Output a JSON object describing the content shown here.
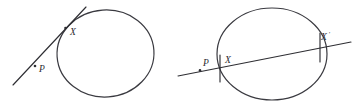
{
  "figure": {
    "background_color": "#ffffff",
    "stroke_color": "#2e2e33",
    "width": 352,
    "height": 108,
    "panels": [
      {
        "name": "tangent-panel",
        "description": "Circle with a tangent line touching at point X, with point P on the tangent line outside the circle",
        "circle": {
          "cx": 105.5,
          "cy": 53.5,
          "rx": 48.5,
          "ry": 43.5,
          "rotation": -4
        },
        "line": {
          "x1": 13,
          "y1": 85,
          "x2": 86,
          "y2": 7
        },
        "points": [
          {
            "label": "P",
            "label_x": 39,
            "label_y": 72,
            "dot_x": 35,
            "dot_y": 66,
            "has_dot": true,
            "prime": ""
          },
          {
            "label": "X",
            "label_x": 70,
            "label_y": 35,
            "dot_x": 65,
            "dot_y": 28,
            "has_dot": true,
            "prime": ""
          }
        ]
      },
      {
        "name": "secant-panel",
        "description": "Circle with a secant line crossing it at points X and X prime, with point P on the line outside the circle",
        "circle": {
          "cx": 272,
          "cy": 54,
          "rx": 55,
          "ry": 46,
          "rotation": 0
        },
        "line": {
          "x1": 178,
          "y1": 76,
          "x2": 351,
          "y2": 42
        },
        "points": [
          {
            "label": "P",
            "label_x": 204,
            "label_y": 66,
            "dot_x": 200,
            "dot_y": 70,
            "has_dot": true,
            "prime": ""
          },
          {
            "label": "X",
            "label_x": 226,
            "label_y": 63,
            "dot_x": 220,
            "dot_y": 68,
            "has_dot": false,
            "prime": ""
          },
          {
            "label": "X",
            "label_x": 322,
            "label_y": 40,
            "dot_x": 318,
            "dot_y": 45,
            "has_dot": false,
            "prime": "′"
          }
        ]
      }
    ]
  }
}
